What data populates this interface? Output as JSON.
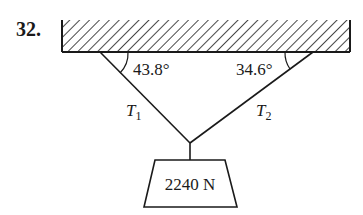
{
  "problem_number": "32.",
  "angles": {
    "left": "43.8°",
    "right": "34.6°"
  },
  "tensions": {
    "left": {
      "symbol": "T",
      "subscript": "1"
    },
    "right": {
      "symbol": "T",
      "subscript": "2"
    }
  },
  "weight": {
    "label": "2240 N"
  },
  "colors": {
    "ink": "#1a1a1a",
    "background": "#ffffff"
  }
}
